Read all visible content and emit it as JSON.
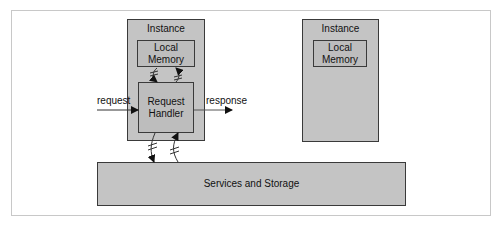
{
  "diagram": {
    "instance_1": {
      "title": "Instance",
      "local_memory": "Local\nMemory",
      "local_memory_lines": [
        "Local",
        "Memory"
      ],
      "handler_lines": [
        "Request",
        "Handler"
      ]
    },
    "instance_2": {
      "title": "Instance",
      "local_memory_lines": [
        "Local",
        "Memory"
      ]
    },
    "services": {
      "label": "Services and Storage"
    },
    "flows": {
      "request": "request",
      "response": "response"
    },
    "colors": {
      "box_fill": "#c4c4c4",
      "border": "#3a3a3a",
      "frame": "#c8c8c8",
      "background": "#ffffff"
    }
  }
}
